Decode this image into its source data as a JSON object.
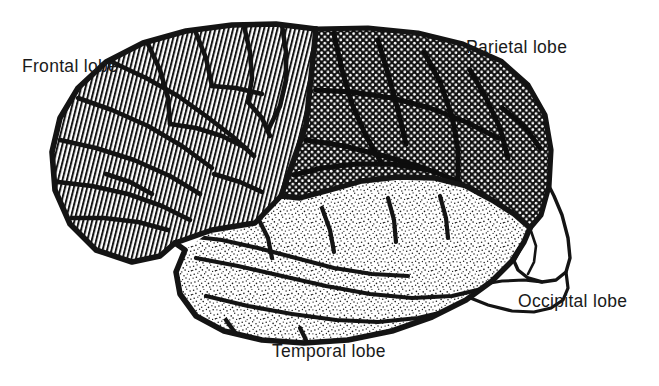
{
  "figure": {
    "view": "left lateral",
    "background_color": "#ffffff",
    "ink_color": "#1a1a1a"
  },
  "labels": {
    "frontal": "Frontal lobe",
    "parietal": "Parietal lobe",
    "temporal": "Temporal lobe",
    "occipital": "Occipital lobe"
  },
  "regions": [
    {
      "name": "frontal-lobe",
      "label": "Frontal lobe",
      "fill_pattern": "vertical-hatch",
      "pattern_description": "close-spaced near-vertical black line hatching on white"
    },
    {
      "name": "parietal-lobe",
      "label": "Parietal lobe",
      "fill_pattern": "dark-checker-dots",
      "pattern_description": "dark halftone, black field with small white dots in a grid"
    },
    {
      "name": "temporal-lobe",
      "label": "Temporal lobe",
      "fill_pattern": "light-stipple",
      "pattern_description": "fine random black stipple dots on white"
    },
    {
      "name": "occipital-lobe",
      "label": "Occipital lobe",
      "fill_pattern": "none",
      "pattern_description": "unfilled white with outline only"
    }
  ]
}
